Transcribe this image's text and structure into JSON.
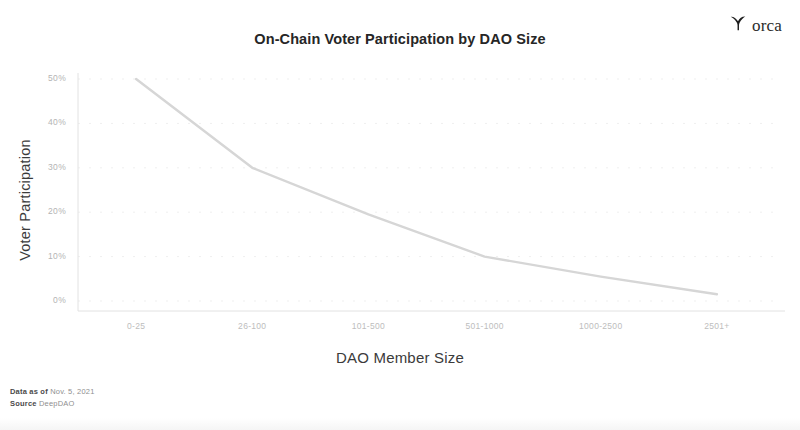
{
  "brand": {
    "name": "orca",
    "icon": "whale-tail-icon"
  },
  "footnote": {
    "data_as_of_label": "Data as of",
    "data_as_of_value": "Nov. 5, 2021",
    "source_label": "Source",
    "source_value": "DeepDAO"
  },
  "chart_data": {
    "type": "line",
    "title": "On-Chain Voter Participation by DAO Size",
    "xlabel": "DAO Member Size",
    "ylabel": "Voter Participation",
    "categories": [
      "0-25",
      "26-100",
      "101-500",
      "501-1000",
      "1000-2500",
      "2501+"
    ],
    "values": [
      50,
      30,
      19.5,
      10,
      5.5,
      1.5
    ],
    "value_labels": [
      "50%",
      "30%",
      "19.5%",
      "10%",
      "5.5%",
      "1.5%"
    ],
    "ytick_labels": [
      "0%",
      "10%",
      "20%",
      "30%",
      "40%",
      "50%"
    ],
    "ytick_values": [
      0,
      10,
      20,
      30,
      40,
      50
    ],
    "ylim": [
      0,
      50
    ],
    "grid": true,
    "legend": "none",
    "line_color": "#d6d6d6",
    "grid_color": "#efefef",
    "axis_color": "#e2e2e2"
  }
}
